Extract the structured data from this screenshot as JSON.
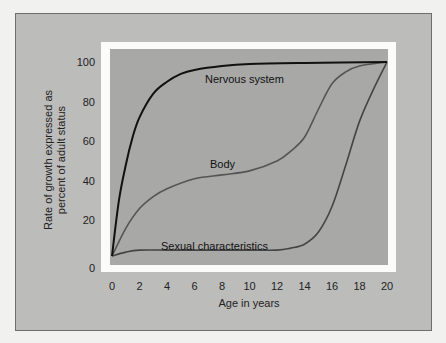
{
  "chart_data": {
    "type": "line",
    "title": "",
    "xlabel": "Age in years",
    "ylabel": "Rate of growth expressed as percent of adult status",
    "ylabel_lines": [
      "Rate of growth expressed as",
      "percent of adult status"
    ],
    "xlim": [
      0,
      20
    ],
    "ylim": [
      0,
      100
    ],
    "x_ticks": [
      0,
      2,
      4,
      6,
      8,
      10,
      12,
      14,
      16,
      18,
      20
    ],
    "y_ticks": [
      0,
      20,
      40,
      60,
      80,
      100
    ],
    "grid": false,
    "legend": "inline annotations",
    "series": [
      {
        "name": "Nervous system",
        "color": "#111111",
        "x": [
          0,
          0.5,
          1,
          1.5,
          2,
          3,
          4,
          5,
          6,
          8,
          10,
          14,
          20
        ],
        "values": [
          2,
          30,
          48,
          62,
          72,
          84,
          90,
          94,
          96,
          98,
          99,
          99.5,
          100
        ]
      },
      {
        "name": "Body",
        "color": "#555555",
        "x": [
          0,
          1,
          2,
          3,
          4,
          6,
          8,
          10,
          12,
          13,
          14,
          15,
          16,
          17,
          18,
          20
        ],
        "values": [
          2,
          16,
          26,
          32,
          36,
          41,
          43,
          45,
          50,
          55,
          62,
          76,
          89,
          95,
          98,
          100
        ]
      },
      {
        "name": "Sexual characteristics",
        "color": "#444444",
        "x": [
          0,
          1,
          2,
          4,
          6,
          8,
          10,
          12,
          13,
          14,
          15,
          16,
          17,
          18,
          19,
          20
        ],
        "values": [
          2,
          4,
          5,
          5,
          5,
          5,
          5,
          5,
          6,
          8,
          14,
          27,
          48,
          70,
          86,
          100
        ]
      }
    ]
  },
  "axes": {
    "x_tick_labels": [
      "0",
      "2",
      "4",
      "6",
      "8",
      "10",
      "12",
      "14",
      "16",
      "18",
      "20"
    ],
    "y_tick_labels": [
      "0",
      "20",
      "40",
      "60",
      "80",
      "100"
    ],
    "xlabel": "Age in years",
    "ylabel_line1": "Rate of growth expressed as",
    "ylabel_line2": "percent of adult status"
  },
  "annotations": {
    "nervous": "Nervous system",
    "body": "Body",
    "sexual": "Sexual characteristics"
  },
  "colors": {
    "page_bg": "#f1f1ef",
    "panel_bg": "#bcbcbb",
    "frame": "#fbfbfa",
    "plot_bg": "#a8a8a7"
  }
}
